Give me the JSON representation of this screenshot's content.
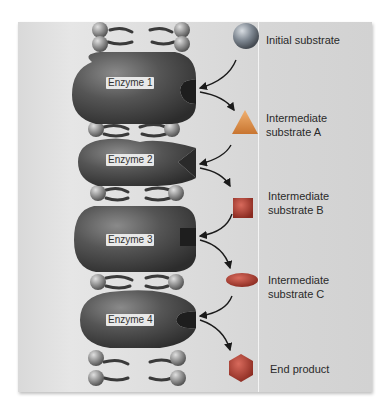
{
  "diagram": {
    "type": "metabolic pathway",
    "enzymes": [
      {
        "label": "Enzyme 1",
        "active_site": "round notch"
      },
      {
        "label": "Enzyme 2",
        "active_site": "v-shaped notch"
      },
      {
        "label": "Enzyme 3",
        "active_site": "square notch"
      },
      {
        "label": "Enzyme 4",
        "active_site": "c-shaped notch"
      }
    ],
    "substrates": [
      {
        "label": "Initial substrate",
        "shape": "sphere",
        "color": "#7e8791"
      },
      {
        "label": "Intermediate substrate A",
        "line1": "Intermediate",
        "line2": "substrate A",
        "shape": "triangle",
        "color": "#d98a3e"
      },
      {
        "label": "Intermediate substrate B",
        "line1": "Intermediate",
        "line2": "substrate B",
        "shape": "square",
        "color": "#9a3a2c"
      },
      {
        "label": "Intermediate substrate C",
        "line1": "Intermediate",
        "line2": "substrate C",
        "shape": "ellipse",
        "color": "#b8473b"
      },
      {
        "label": "End product",
        "shape": "hexagon",
        "color": "#b0463a"
      }
    ],
    "colors": {
      "enzyme": "#4a4a4a",
      "membrane_head": "#8a8a8a",
      "arrow": "#1a1a1a",
      "background": "#dcdcdc"
    }
  }
}
